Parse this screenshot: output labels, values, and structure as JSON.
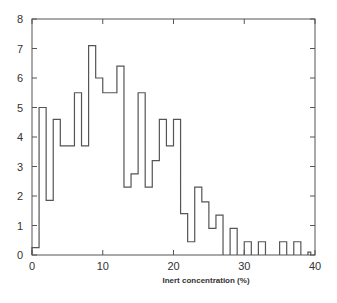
{
  "chart_data": {
    "type": "bar",
    "style": "step-histogram",
    "title": "",
    "xlabel": "Inert concentration (%)",
    "ylabel": "",
    "xlim": [
      0,
      40
    ],
    "ylim": [
      0,
      8
    ],
    "grid": false,
    "legend": null,
    "x_ticks": [
      0,
      10,
      20,
      30,
      40
    ],
    "y_ticks": [
      0,
      1,
      2,
      3,
      4,
      5,
      6,
      7,
      8
    ],
    "bins": [
      {
        "x0": 0,
        "x1": 1,
        "value": 0.25
      },
      {
        "x0": 1,
        "x1": 2,
        "value": 5.0
      },
      {
        "x0": 2,
        "x1": 3,
        "value": 1.85
      },
      {
        "x0": 3,
        "x1": 4,
        "value": 4.6
      },
      {
        "x0": 4,
        "x1": 6,
        "value": 3.7
      },
      {
        "x0": 6,
        "x1": 7,
        "value": 5.5
      },
      {
        "x0": 7,
        "x1": 8,
        "value": 3.7
      },
      {
        "x0": 8,
        "x1": 9,
        "value": 7.1
      },
      {
        "x0": 9,
        "x1": 10,
        "value": 6.0
      },
      {
        "x0": 10,
        "x1": 12,
        "value": 5.5
      },
      {
        "x0": 12,
        "x1": 13,
        "value": 6.4
      },
      {
        "x0": 13,
        "x1": 14,
        "value": 2.3
      },
      {
        "x0": 14,
        "x1": 15,
        "value": 2.75
      },
      {
        "x0": 15,
        "x1": 16,
        "value": 5.5
      },
      {
        "x0": 16,
        "x1": 17,
        "value": 2.3
      },
      {
        "x0": 17,
        "x1": 18,
        "value": 3.2
      },
      {
        "x0": 18,
        "x1": 19,
        "value": 4.6
      },
      {
        "x0": 19,
        "x1": 20,
        "value": 3.7
      },
      {
        "x0": 20,
        "x1": 21,
        "value": 4.6
      },
      {
        "x0": 21,
        "x1": 22,
        "value": 1.4
      },
      {
        "x0": 22,
        "x1": 23,
        "value": 0.45
      },
      {
        "x0": 23,
        "x1": 24,
        "value": 2.3
      },
      {
        "x0": 24,
        "x1": 25,
        "value": 1.8
      },
      {
        "x0": 25,
        "x1": 26,
        "value": 0.9
      },
      {
        "x0": 26,
        "x1": 27,
        "value": 1.35
      },
      {
        "x0": 28,
        "x1": 29,
        "value": 0.9
      },
      {
        "x0": 30,
        "x1": 31,
        "value": 0.45
      },
      {
        "x0": 32,
        "x1": 33,
        "value": 0.45
      },
      {
        "x0": 35,
        "x1": 36,
        "value": 0.45
      },
      {
        "x0": 37,
        "x1": 38,
        "value": 0.45
      },
      {
        "x0": 39,
        "x1": 39.4,
        "value": 0.1
      }
    ]
  },
  "colors": {
    "line": "#555555",
    "text": "#333333",
    "background": "#ffffff"
  }
}
